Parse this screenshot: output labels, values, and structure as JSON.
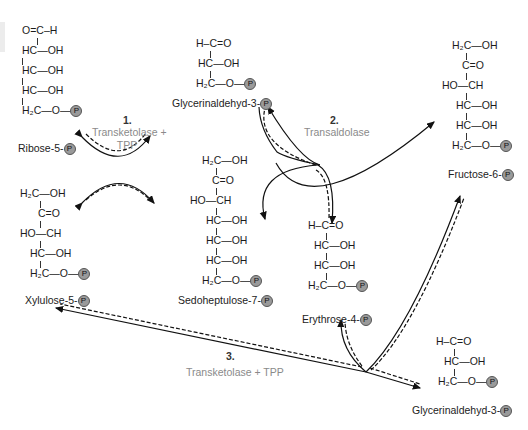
{
  "figure": {
    "colors": {
      "text": "#1c1c1c",
      "enzyme": "#8a8a8a",
      "highlight": "#9a9a9a",
      "phosphate": "#9a9a9a",
      "arrow": "#111111"
    }
  },
  "molecules": {
    "ribose5p": {
      "name": "Ribose-5-",
      "rows": [
        "O=C–H",
        "HC—OH",
        "HC—OH",
        "HC—OH",
        "H₂C—O—"
      ]
    },
    "xylulose5p": {
      "name": "Xylulose-5-",
      "rows": [
        "H₂C—OH",
        "C=O",
        "HO—CH",
        "HC—OH",
        "H₂C—O—"
      ]
    },
    "gap_top": {
      "name": "Glycerinaldehyd-3-",
      "rows": [
        "H–C=O",
        "HC—OH",
        "H₂C—O—"
      ]
    },
    "sedoheptulose7p": {
      "name": "Sedoheptulose-7-",
      "rows": [
        "H₂C—OH",
        "C=O",
        "HO—CH",
        "HC—OH",
        "HC—OH",
        "HC—OH",
        "H₂C—O—"
      ]
    },
    "erythrose4p": {
      "name": "Erythrose-4-",
      "rows": [
        "H–C=O",
        "HC—OH",
        "HC—OH",
        "H₂C—O—"
      ]
    },
    "fructose6p": {
      "name": "Fructose-6-",
      "rows": [
        "H₂C—OH",
        "C=O",
        "HO—CH",
        "HC—OH",
        "HC—OH",
        "H₂C—O—"
      ]
    },
    "gap_bottom": {
      "name": "Glycerinaldehyd-3-",
      "rows": [
        "H–C=O",
        "HC—OH",
        "H₂C—O—"
      ]
    }
  },
  "phosphate_symbol": "P",
  "reactions": [
    {
      "step": "1.",
      "enzyme_line1": "Transketolase +",
      "enzyme_line2": "TPP"
    },
    {
      "step": "2.",
      "enzyme_line1": "Transaldolase",
      "enzyme_line2": ""
    },
    {
      "step": "3.",
      "enzyme_line1": "Transketolase + TPP",
      "enzyme_line2": ""
    }
  ]
}
